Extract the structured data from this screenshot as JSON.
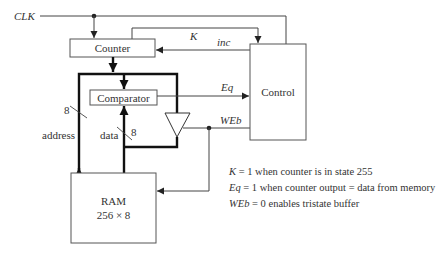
{
  "signals": {
    "clk": "CLK",
    "k": "K",
    "inc": "inc",
    "eq": "Eq",
    "web": "WEb",
    "address": "address",
    "data": "data",
    "address_width": "8",
    "data_width": "8"
  },
  "blocks": {
    "counter": "Counter",
    "comparator": "Comparator",
    "control": "Control",
    "ram_title": "RAM",
    "ram_size": "256 × 8"
  },
  "notes": [
    {
      "var": "K",
      "text": " = 1 when counter is in state 255"
    },
    {
      "var": "Eq",
      "text": " = 1 when counter output = data from memory"
    },
    {
      "var": "WEb",
      "text": " = 0 enables tristate buffer"
    }
  ],
  "colors": {
    "line": "#444444",
    "bus": "#111111",
    "background": "#ffffff"
  }
}
